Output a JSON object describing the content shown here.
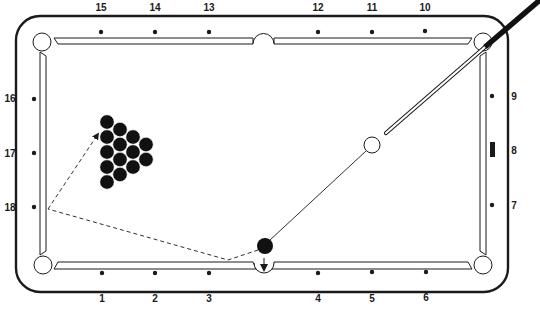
{
  "diagram": {
    "type": "pool-table-diagram",
    "colors": {
      "line": "#1a1a1a",
      "background": "#ffffff",
      "ball_black": "#111111",
      "ball_white": "#ffffff"
    },
    "diamonds": {
      "top": [
        {
          "label": "15",
          "x": 101
        },
        {
          "label": "14",
          "x": 155
        },
        {
          "label": "13",
          "x": 209
        },
        {
          "label": "12",
          "x": 318
        },
        {
          "label": "11",
          "x": 372
        },
        {
          "label": "10",
          "x": 425
        }
      ],
      "bottom": [
        {
          "label": "1",
          "x": 102
        },
        {
          "label": "2",
          "x": 155
        },
        {
          "label": "3",
          "x": 209
        },
        {
          "label": "4",
          "x": 318
        },
        {
          "label": "5",
          "x": 372
        },
        {
          "label": "6",
          "x": 426
        }
      ],
      "left": [
        {
          "label": "16",
          "y": 98
        },
        {
          "label": "17",
          "y": 153
        },
        {
          "label": "18",
          "y": 207
        }
      ],
      "right": [
        {
          "label": "9",
          "y": 97
        },
        {
          "label": "8",
          "y": 150,
          "marker": "rect"
        },
        {
          "label": "7",
          "y": 206
        }
      ]
    },
    "rack": {
      "ball_count": 15,
      "color": "black",
      "shape": "triangle"
    },
    "cue_ball": {
      "x": 372,
      "y": 145,
      "color": "white"
    },
    "object_ball": {
      "x": 265,
      "y": 246,
      "color": "black"
    },
    "cue_stick": {
      "from": [
        386,
        133
      ],
      "to": [
        540,
        0
      ]
    },
    "paths": [
      {
        "type": "solid",
        "description": "aim-line"
      },
      {
        "type": "dashed",
        "description": "cue-ball-path-to-rack"
      }
    ]
  }
}
